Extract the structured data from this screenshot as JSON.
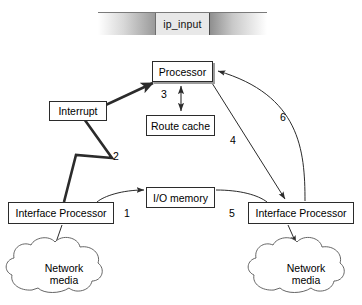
{
  "banner": {
    "label": "ip_input",
    "segments": [
      "",
      "ip_input",
      ""
    ]
  },
  "nodes": {
    "processor": "Processor",
    "route_cache": "Route cache",
    "interrupt": "Interrupt",
    "io_memory": "I/O memory",
    "interface_processor_left": "Interface Processor",
    "interface_processor_right": "Interface Processor",
    "network_media_left": "Network\nmedia",
    "network_media_left_line1": "Network",
    "network_media_left_line2": "media",
    "network_media_right_line1": "Network",
    "network_media_right_line2": "media"
  },
  "edges": [
    {
      "id": "1",
      "label": "1",
      "from": "interface_processor_left",
      "to": "io_memory",
      "style": "thin-curve-arrow"
    },
    {
      "id": "2",
      "label": "2",
      "from": "interface_processor_left",
      "to": "processor",
      "style": "thick-zigzag-arrow"
    },
    {
      "id": "3",
      "label": "3",
      "from": "processor",
      "to": "route_cache",
      "style": "thin-double-arrow"
    },
    {
      "id": "4",
      "label": "4",
      "from": "processor",
      "to": "interface_processor_right",
      "style": "thin-diagonal-arrow"
    },
    {
      "id": "5",
      "label": "5",
      "from": "io_memory",
      "to": "interface_processor_right",
      "style": "thin-curve"
    },
    {
      "id": "6",
      "label": "6",
      "from": "interface_processor_right",
      "to": "processor",
      "style": "thin-curve-arrow"
    }
  ],
  "links": [
    {
      "from": "interface_processor_left",
      "to": "network_media_left",
      "style": "plain-line"
    },
    {
      "from": "interface_processor_right",
      "to": "network_media_right",
      "style": "plain-arrow"
    }
  ],
  "colors": {
    "stroke": "#2b2b2b",
    "cloud_stroke": "#555555",
    "shadow": "#9b9b9b",
    "background": "#ffffff",
    "banner_mid": "#e8e8e8"
  }
}
